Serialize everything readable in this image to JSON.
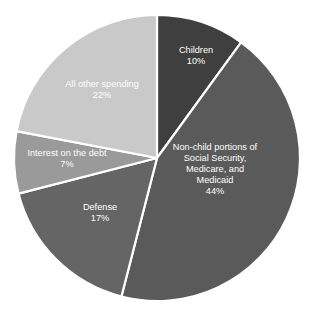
{
  "chart_data": {
    "type": "pie",
    "title": "",
    "subtitle": "",
    "xlabel": "",
    "ylabel": "",
    "legend_position": "none",
    "grid": false,
    "labels_inside_slices": true,
    "start_angle_deg": 0,
    "direction": "clockwise",
    "units": "percent",
    "total": 100,
    "categories": [
      "Children",
      "Non-child portions of Social Security, Medicare, and Medicaid",
      "Defense",
      "Interest on the debt",
      "All other spending"
    ],
    "values": [
      10,
      44,
      17,
      7,
      22
    ],
    "colors": [
      "#3f3f3f",
      "#5a5a5a",
      "#656565",
      "#9a9a9a",
      "#c9c9c9"
    ],
    "slices": [
      {
        "name": "children",
        "label_lines": [
          "Children"
        ],
        "value": 10,
        "pct_text": "10%",
        "color": "#3f3f3f",
        "label_x": 196,
        "label_y": 56
      },
      {
        "name": "non-child-entitlements",
        "label_lines": [
          "Non-child portions of",
          "Social Security,",
          "Medicare, and",
          "Medicaid"
        ],
        "value": 44,
        "pct_text": "44%",
        "color": "#5a5a5a",
        "label_x": 215,
        "label_y": 170
      },
      {
        "name": "defense",
        "label_lines": [
          "Defense"
        ],
        "value": 17,
        "pct_text": "17%",
        "color": "#656565",
        "label_x": 100,
        "label_y": 213
      },
      {
        "name": "interest-on-the-debt",
        "label_lines": [
          "Interest on the debt"
        ],
        "value": 7,
        "pct_text": "7%",
        "color": "#9a9a9a",
        "label_x": 67,
        "label_y": 159
      },
      {
        "name": "all-other-spending",
        "label_lines": [
          "All other spending"
        ],
        "value": 22,
        "pct_text": "22%",
        "color": "#c9c9c9",
        "label_x": 102,
        "label_y": 90
      }
    ],
    "geometry": {
      "center_x": 157,
      "center_y": 158,
      "radius": 143,
      "separator_color": "#ffffff",
      "background_color": "#ffffff",
      "label_text_color": "#ffffff"
    }
  }
}
